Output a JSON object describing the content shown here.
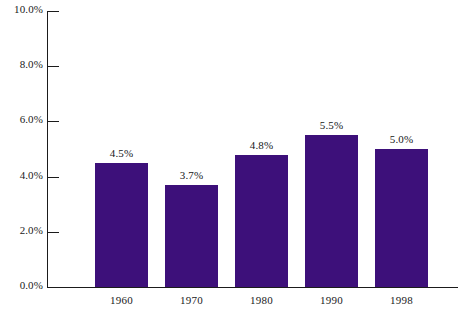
{
  "chart_data": {
    "type": "bar",
    "title": "",
    "subtitle": "",
    "xlabel": "",
    "ylabel": "",
    "categories": [
      "1960",
      "1970",
      "1980",
      "1990",
      "1998"
    ],
    "values": [
      4.5,
      3.7,
      4.8,
      5.5,
      5.0
    ],
    "value_labels": [
      "4.5%",
      "3.7%",
      "4.8%",
      "5.5%",
      "5.0%"
    ],
    "ylim": [
      0,
      10
    ],
    "ytick_values": [
      0,
      2,
      4,
      6,
      8,
      10
    ],
    "ytick_labels": [
      "0.0%",
      "2.0%",
      "4.0%",
      "6.0%",
      "8.0%",
      "10.0%"
    ],
    "grid": false,
    "legend": false,
    "legend_position": "none",
    "series": [
      {
        "name": "",
        "values": [
          4.5,
          3.7,
          4.8,
          5.5,
          5.0
        ],
        "color": "#3d107a"
      }
    ],
    "colors": {
      "bar": "#3d107a",
      "axis": "#1b1b1b",
      "text": "#1a1a1a",
      "background": "#ffffff"
    }
  }
}
